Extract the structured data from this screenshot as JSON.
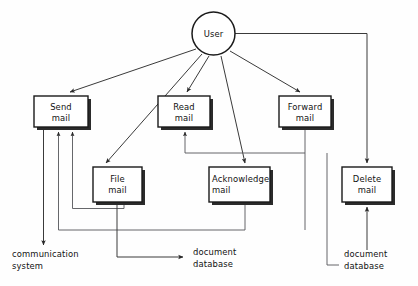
{
  "diagram": {
    "type": "data-flow-diagram",
    "colors": {
      "background": "#fefefe",
      "box_fill": "#ffffff",
      "box_stroke": "#1a1a1a",
      "box_shadow": "#2b2b2b",
      "line": "#3a3a3a",
      "text": "#111111"
    },
    "actor": {
      "id": "user",
      "label": "User",
      "shape": "circle",
      "cx": 213.5,
      "cy": 33.5,
      "r": 21.5
    },
    "processes": [
      {
        "id": "send-mail",
        "label_line1": "Send",
        "label_line2": "mail",
        "align": "center",
        "x": 34,
        "y": 96,
        "w": 54,
        "h": 31
      },
      {
        "id": "read-mail",
        "label_line1": "Read",
        "label_line2": "mail",
        "align": "center",
        "x": 158,
        "y": 96,
        "w": 52,
        "h": 31
      },
      {
        "id": "forward-mail",
        "label_line1": "Forward",
        "label_line2": "mail",
        "align": "center",
        "x": 279,
        "y": 96,
        "w": 52,
        "h": 31
      },
      {
        "id": "file-mail",
        "label_line1": "File",
        "label_line2": "mail",
        "align": "center",
        "x": 93,
        "y": 167,
        "w": 49,
        "h": 35
      },
      {
        "id": "acknowledge-mail",
        "label_line1": "Acknowledge",
        "label_line2": "mail",
        "align": "left",
        "x": 209,
        "y": 167,
        "w": 61,
        "h": 35
      },
      {
        "id": "delete-mail",
        "label_line1": "Delete",
        "label_line2": "mail",
        "align": "center",
        "x": 342,
        "y": 167,
        "w": 50,
        "h": 35
      }
    ],
    "sinks": [
      {
        "id": "communication-system",
        "label_line1": "communication",
        "label_line2": "system",
        "x": 12,
        "y": 254
      },
      {
        "id": "document-database-left",
        "label_line1": "document",
        "label_line2": "database",
        "x": 193,
        "y": 254
      },
      {
        "id": "document-database-right",
        "label_line1": "document",
        "label_line2": "database",
        "x": 344,
        "y": 254
      }
    ],
    "flows": [
      {
        "id": "user-to-send-mail",
        "from": "user",
        "to": "send-mail"
      },
      {
        "id": "user-to-file-mail",
        "from": "user",
        "to": "file-mail"
      },
      {
        "id": "user-to-read-mail",
        "from": "user",
        "to": "read-mail"
      },
      {
        "id": "user-to-acknowledge-mail",
        "from": "user",
        "to": "acknowledge-mail"
      },
      {
        "id": "user-to-forward-mail",
        "from": "user",
        "to": "forward-mail"
      },
      {
        "id": "user-to-delete-mail",
        "from": "user",
        "to": "delete-mail"
      },
      {
        "id": "send-mail-to-communication-system",
        "from": "send-mail",
        "to": "communication-system"
      },
      {
        "id": "file-mail-to-send-mail",
        "from": "file-mail",
        "to": "send-mail"
      },
      {
        "id": "acknowledge-mail-to-send-mail",
        "from": "acknowledge-mail",
        "to": "send-mail"
      },
      {
        "id": "file-mail-to-document-database",
        "from": "file-mail",
        "to": "document-database-left"
      },
      {
        "id": "forward-mail-to-read-mail",
        "from": "forward-mail",
        "to": "read-mail"
      },
      {
        "id": "document-database-to-delete-mail",
        "from": "document-database-right",
        "to": "delete-mail"
      }
    ]
  }
}
